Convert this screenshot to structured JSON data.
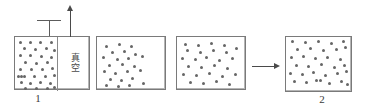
{
  "figure": {
    "type": "diagram",
    "width": 366,
    "height": 110,
    "background_color": "#ffffff",
    "particle_color": "#666666",
    "border_color": "#7a7a7a",
    "line_color": "#4a4a4a"
  },
  "labels": {
    "vacuum_char_1": "真",
    "vacuum_char_2": "空",
    "caption_left": "1",
    "caption_right": "2"
  },
  "vessels": [
    {
      "id": "vessel-1",
      "x": 14,
      "y": 36,
      "width": 76,
      "height": 54,
      "partition_x": 42,
      "note": "left chamber filled with gas, right chamber is vacuum"
    },
    {
      "id": "vessel-2",
      "x": 96,
      "y": 36,
      "width": 70,
      "height": 54,
      "partition_x": null,
      "note": "partition removed, gas begins expanding"
    },
    {
      "id": "vessel-3",
      "x": 176,
      "y": 36,
      "width": 70,
      "height": 54,
      "partition_x": null,
      "note": "gas spreading further"
    },
    {
      "id": "vessel-4",
      "x": 285,
      "y": 36,
      "width": 67,
      "height": 56,
      "partition_x": null,
      "note": "gas uniformly distributed at equilibrium"
    }
  ],
  "particles": {
    "vessel_1": [
      [
        4,
        4
      ],
      [
        14,
        4
      ],
      [
        24,
        4
      ],
      [
        35,
        4
      ],
      [
        8,
        10
      ],
      [
        19,
        11
      ],
      [
        30,
        10
      ],
      [
        38,
        12
      ],
      [
        4,
        17
      ],
      [
        14,
        17
      ],
      [
        25,
        18
      ],
      [
        35,
        19
      ],
      [
        9,
        24
      ],
      [
        20,
        25
      ],
      [
        31,
        24
      ],
      [
        4,
        31
      ],
      [
        15,
        31
      ],
      [
        26,
        31
      ],
      [
        36,
        30
      ],
      [
        2,
        38
      ],
      [
        5,
        38
      ],
      [
        8,
        38
      ],
      [
        18,
        38
      ],
      [
        29,
        38
      ],
      [
        38,
        37
      ],
      [
        5,
        44
      ],
      [
        14,
        45
      ],
      [
        24,
        44
      ],
      [
        34,
        45
      ],
      [
        9,
        50
      ],
      [
        20,
        50
      ],
      [
        31,
        50
      ],
      [
        38,
        49
      ]
    ],
    "vessel_2": [
      [
        8,
        8
      ],
      [
        21,
        6
      ],
      [
        33,
        8
      ],
      [
        14,
        14
      ],
      [
        26,
        13
      ],
      [
        37,
        16
      ],
      [
        5,
        19
      ],
      [
        19,
        21
      ],
      [
        30,
        20
      ],
      [
        44,
        18
      ],
      [
        11,
        27
      ],
      [
        24,
        26
      ],
      [
        36,
        28
      ],
      [
        6,
        33
      ],
      [
        17,
        35
      ],
      [
        29,
        33
      ],
      [
        42,
        32
      ],
      [
        12,
        41
      ],
      [
        23,
        42
      ],
      [
        34,
        40
      ],
      [
        8,
        47
      ],
      [
        20,
        48
      ],
      [
        31,
        47
      ],
      [
        45,
        45
      ]
    ],
    "vessel_3": [
      [
        7,
        6
      ],
      [
        20,
        7
      ],
      [
        33,
        5
      ],
      [
        46,
        7
      ],
      [
        9,
        12
      ],
      [
        22,
        14
      ],
      [
        35,
        12
      ],
      [
        48,
        14
      ],
      [
        58,
        10
      ],
      [
        4,
        20
      ],
      [
        17,
        21
      ],
      [
        28,
        19
      ],
      [
        41,
        22
      ],
      [
        54,
        20
      ],
      [
        10,
        28
      ],
      [
        23,
        29
      ],
      [
        36,
        27
      ],
      [
        49,
        30
      ],
      [
        5,
        36
      ],
      [
        18,
        37
      ],
      [
        31,
        35
      ],
      [
        44,
        38
      ],
      [
        57,
        36
      ],
      [
        12,
        44
      ],
      [
        25,
        45
      ],
      [
        38,
        43
      ],
      [
        51,
        46
      ]
    ],
    "vessel_4": [
      [
        5,
        3
      ],
      [
        18,
        4
      ],
      [
        31,
        3
      ],
      [
        44,
        5
      ],
      [
        56,
        3
      ],
      [
        10,
        11
      ],
      [
        23,
        10
      ],
      [
        36,
        12
      ],
      [
        49,
        11
      ],
      [
        58,
        9
      ],
      [
        4,
        19
      ],
      [
        16,
        18
      ],
      [
        28,
        20
      ],
      [
        40,
        19
      ],
      [
        53,
        21
      ],
      [
        9,
        27
      ],
      [
        21,
        28
      ],
      [
        34,
        26
      ],
      [
        47,
        29
      ],
      [
        57,
        27
      ],
      [
        3,
        35
      ],
      [
        15,
        36
      ],
      [
        26,
        34
      ],
      [
        38,
        37
      ],
      [
        50,
        35
      ],
      [
        59,
        33
      ],
      [
        7,
        43
      ],
      [
        19,
        44
      ],
      [
        29,
        42
      ],
      [
        33,
        42
      ],
      [
        42,
        45
      ],
      [
        54,
        43
      ],
      [
        60,
        46
      ]
    ]
  },
  "valve": {
    "bar_x": 37,
    "bar_y": 20,
    "bar_width": 24,
    "stem_x": 49,
    "stem_y": 20,
    "stem_height": 16
  },
  "arrow_up": {
    "x": 70,
    "shaft_top": 11,
    "shaft_bottom": 37
  },
  "arrow_right": {
    "y": 66,
    "shaft_left": 252,
    "shaft_right": 274
  },
  "captions": [
    {
      "text": "1",
      "x": 31,
      "y": 92
    },
    {
      "text": "2",
      "x": 315,
      "y": 93
    }
  ]
}
